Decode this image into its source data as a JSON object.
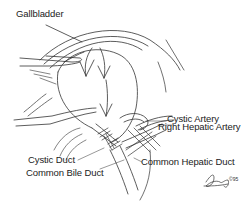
{
  "diagram": {
    "labels": {
      "gallbladder": "Gallbladder",
      "cystic_artery": "Cystic Artery",
      "right_hepatic_artery": "Right Hepatic Artery",
      "cystic_duct": "Cystic Duct",
      "common_hepatic_duct": "Common Hepatic Duct",
      "common_bile_duct": "Common Bile Duct"
    },
    "signature": {
      "year_mark": "©95"
    },
    "colors": {
      "line": "#333333",
      "text": "#222222",
      "background": "#ffffff"
    }
  }
}
